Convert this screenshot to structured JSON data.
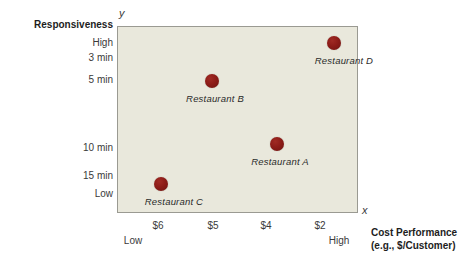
{
  "chart_data": {
    "type": "scatter",
    "title": "",
    "xlabel": "Cost Performance",
    "xlabel_sub": "(e.g., $/Customer)",
    "ylabel": "Responsiveness",
    "x_axis_letter": "x",
    "y_axis_letter": "y",
    "grid": false,
    "legend": "none",
    "x_ticks": [
      {
        "label": "$6",
        "px": 158
      },
      {
        "label": "$5",
        "px": 213
      },
      {
        "label": "$4",
        "px": 266
      },
      {
        "label": "$2",
        "px": 320
      }
    ],
    "x_low_label": "Low",
    "x_high_label": "High",
    "y_ticks": [
      {
        "label": "3 min",
        "px": 58
      },
      {
        "label": "5 min",
        "px": 80
      },
      {
        "label": "10 min",
        "px": 148
      },
      {
        "label": "15 min",
        "px": 176
      }
    ],
    "y_high_label": "High",
    "y_low_label": "Low",
    "points": [
      {
        "name": "Restaurant D",
        "x": "$2",
        "y": "under 3 min",
        "px": 333,
        "py": 42,
        "label_dx": 10,
        "label_dy": 12
      },
      {
        "name": "Restaurant B",
        "x": "$5",
        "y": "4 min",
        "px": 211,
        "py": 80,
        "label_dx": 3,
        "label_dy": 12
      },
      {
        "name": "Restaurant A",
        "x": "$4",
        "y": "10 min",
        "px": 276,
        "py": 143,
        "label_dx": 3,
        "label_dy": 12
      },
      {
        "name": "Restaurant C",
        "x": "$6",
        "y": "15 min",
        "px": 160,
        "py": 183,
        "label_dx": 13,
        "label_dy": 12
      }
    ],
    "marker_color": "#8d1c18",
    "plot_background": "#e9e8dc",
    "plot_border_color": "#9a9a92"
  }
}
